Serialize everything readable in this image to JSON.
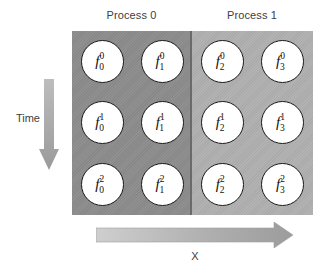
{
  "diagram": {
    "panels": [
      {
        "id": "process-0",
        "label": "Process 0",
        "color": "#8c8c8c"
      },
      {
        "id": "process-1",
        "label": "Process 1",
        "color": "#b0b0b0"
      }
    ],
    "axes": {
      "vertical": {
        "label": "Time",
        "direction": "down",
        "color": "#a6a6a6"
      },
      "horizontal": {
        "label": "X",
        "direction": "right",
        "color": "#a6a6a6"
      }
    },
    "grid": {
      "columns": 4,
      "rows": 3,
      "node_base": "f",
      "column_subscripts": [
        "0",
        "1",
        "2",
        "3"
      ],
      "row_superscripts": [
        "0",
        "1",
        "2"
      ],
      "node_fill": "#ffffff",
      "node_stroke": "#1a1a1a"
    },
    "nodes": [
      {
        "base": "f",
        "sub": "0",
        "sup": "0",
        "process": "Process 0"
      },
      {
        "base": "f",
        "sub": "1",
        "sup": "0",
        "process": "Process 0"
      },
      {
        "base": "f",
        "sub": "2",
        "sup": "0",
        "process": "Process 1"
      },
      {
        "base": "f",
        "sub": "3",
        "sup": "0",
        "process": "Process 1"
      },
      {
        "base": "f",
        "sub": "0",
        "sup": "1",
        "process": "Process 0"
      },
      {
        "base": "f",
        "sub": "1",
        "sup": "1",
        "process": "Process 0"
      },
      {
        "base": "f",
        "sub": "2",
        "sup": "1",
        "process": "Process 1"
      },
      {
        "base": "f",
        "sub": "3",
        "sup": "1",
        "process": "Process 1"
      },
      {
        "base": "f",
        "sub": "0",
        "sup": "2",
        "process": "Process 0"
      },
      {
        "base": "f",
        "sub": "1",
        "sup": "2",
        "process": "Process 0"
      },
      {
        "base": "f",
        "sub": "2",
        "sup": "2",
        "process": "Process 1"
      },
      {
        "base": "f",
        "sub": "3",
        "sup": "2",
        "process": "Process 1"
      }
    ]
  }
}
